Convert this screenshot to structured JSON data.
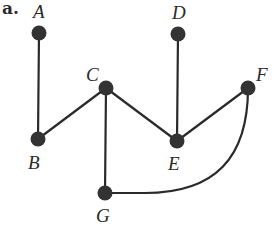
{
  "figure": {
    "panel_label": "a.",
    "colors": {
      "ink": "#2a2a2a",
      "node": "#333333",
      "background": "#ffffff"
    },
    "nodes": [
      {
        "id": "A",
        "label": "A",
        "x": 39,
        "y": 33,
        "label_x": 33,
        "label_y": 18
      },
      {
        "id": "B",
        "label": "B",
        "x": 38,
        "y": 139,
        "label_x": 28,
        "label_y": 169
      },
      {
        "id": "C",
        "label": "C",
        "x": 106,
        "y": 88,
        "label_x": 86,
        "label_y": 81
      },
      {
        "id": "D",
        "label": "D",
        "x": 178,
        "y": 34,
        "label_x": 172,
        "label_y": 19
      },
      {
        "id": "E",
        "label": "E",
        "x": 177,
        "y": 141,
        "label_x": 168,
        "label_y": 170
      },
      {
        "id": "F",
        "label": "F",
        "x": 248,
        "y": 88,
        "label_x": 256,
        "label_y": 81
      },
      {
        "id": "G",
        "label": "G",
        "x": 105,
        "y": 193,
        "label_x": 96,
        "label_y": 222
      }
    ],
    "edges": [
      {
        "from": "A",
        "to": "B",
        "type": "straight"
      },
      {
        "from": "B",
        "to": "C",
        "type": "straight"
      },
      {
        "from": "C",
        "to": "E",
        "type": "straight"
      },
      {
        "from": "C",
        "to": "G",
        "type": "straight"
      },
      {
        "from": "D",
        "to": "E",
        "type": "straight"
      },
      {
        "from": "E",
        "to": "F",
        "type": "straight"
      },
      {
        "from": "G",
        "to": "F",
        "type": "curved"
      }
    ]
  }
}
